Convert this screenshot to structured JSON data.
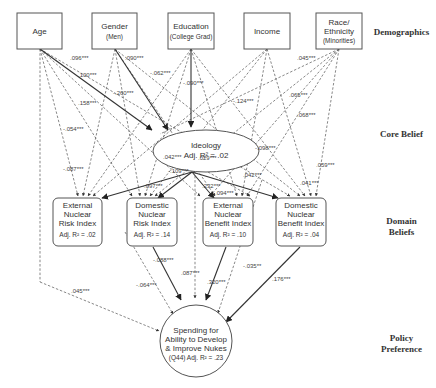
{
  "levels": {
    "demographics": "Demographics",
    "core_belief": "Core Belief",
    "domain_beliefs_1": "Domain",
    "domain_beliefs_2": "Beliefs",
    "policy_1": "Policy",
    "policy_2": "Preference"
  },
  "demographics": {
    "age": {
      "line1": "Age"
    },
    "gender": {
      "line1": "Gender",
      "line2": "(Men)"
    },
    "education": {
      "line1": "Education",
      "line2": "(College Grad)"
    },
    "income": {
      "line1": "Income"
    },
    "race": {
      "line1": "Race/",
      "line2": "Ethnicity",
      "line3": "(Minorities)"
    }
  },
  "ideology": {
    "line1": "Ideology",
    "line2": "Adj. R² = .02"
  },
  "domain": {
    "ext_risk": {
      "line1": "External",
      "line2": "Nuclear",
      "line3": "Risk Index",
      "line4": "Adj. R² = .02"
    },
    "dom_risk": {
      "line1": "Domestic",
      "line2": "Nuclear",
      "line3": "Risk Index",
      "line4": "Adj. R² = .14"
    },
    "ext_benefit": {
      "line1": "External",
      "line2": "Nuclear",
      "line3": "Benefit Index",
      "line4": "Adj. R² = .10"
    },
    "dom_benefit": {
      "line1": "Domestic",
      "line2": "Nuclear",
      "line3": "Benefit Index",
      "line4": "Adj. R² = .04"
    }
  },
  "outcome": {
    "line1": "Spending for",
    "line2": "Ability to Develop",
    "line3": "& Improve Nukes",
    "line4": "(Q44)  Adj. R² = .23"
  },
  "coefficients": {
    "c1": ".096***",
    "c2": ".090***",
    "c3": ".100***",
    "c4": "-.062***",
    "c5": "-.260***",
    "c6": "-.090***",
    "c7": ".045***",
    "c8": ".158***",
    "c9": "-.124***",
    "c10": ".065***",
    "c11": "-.054***",
    "c12": ".068***",
    "c13": "-.087***",
    "c14": "-.098***",
    "c15": ".042***",
    "c16": ".029***",
    "c17": "-.109***",
    "c18": ".059***",
    "c19": "-.097***",
    "c20": ".042***",
    "c21": ".232***",
    "c22": ".041***",
    "c23": "-.094***",
    "c24": "-.088***",
    "c25": ".087***",
    "c26": "-.035**",
    "c27": "-.064***",
    "c28": ".320***",
    "c29": ".176***",
    "c30": ".045***"
  }
}
